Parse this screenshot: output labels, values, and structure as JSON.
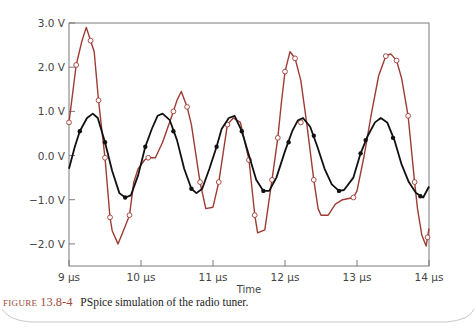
{
  "chart_data": {
    "type": "line",
    "title": "",
    "xlabel": "Time",
    "ylabel": "",
    "xlim": [
      9,
      14
    ],
    "ylim": [
      -2.5,
      3.0
    ],
    "grid": false,
    "legend": "none",
    "x_ticks": [
      {
        "value": 9,
        "label": "9 µs"
      },
      {
        "value": 10,
        "label": "10 µs"
      },
      {
        "value": 11,
        "label": "11 µs"
      },
      {
        "value": 12,
        "label": "12 µs"
      },
      {
        "value": 13,
        "label": "13 µs"
      },
      {
        "value": 14,
        "label": "14 µs"
      }
    ],
    "y_ticks": [
      {
        "value": 3.0,
        "label": "3.0 V"
      },
      {
        "value": 2.0,
        "label": "2.0 V"
      },
      {
        "value": 1.0,
        "label": "1.0 V"
      },
      {
        "value": 0.0,
        "label": "0.0 V"
      },
      {
        "value": -1.0,
        "label": "-1.0 V"
      },
      {
        "value": -2.0,
        "label": "-2.0 V"
      }
    ],
    "series": [
      {
        "name": "output (open-circle markers)",
        "color": "#9e3b33",
        "marker": "open-circle",
        "points": [
          [
            9.0,
            0.75
          ],
          [
            9.1,
            2.05
          ],
          [
            9.18,
            2.6
          ],
          [
            9.24,
            2.9
          ],
          [
            9.3,
            2.6
          ],
          [
            9.35,
            2.35
          ],
          [
            9.41,
            1.25
          ],
          [
            9.5,
            -0.05
          ],
          [
            9.57,
            -1.4
          ],
          [
            9.6,
            -1.7
          ],
          [
            9.68,
            -2.0
          ],
          [
            9.78,
            -1.6
          ],
          [
            9.84,
            -1.35
          ],
          [
            9.9,
            -0.6
          ],
          [
            9.96,
            -0.3
          ],
          [
            10.05,
            -0.1
          ],
          [
            10.1,
            -0.05
          ],
          [
            10.2,
            -0.05
          ],
          [
            10.3,
            0.3
          ],
          [
            10.45,
            1.0
          ],
          [
            10.5,
            1.25
          ],
          [
            10.56,
            1.45
          ],
          [
            10.64,
            1.1
          ],
          [
            10.7,
            0.7
          ],
          [
            10.82,
            -0.6
          ],
          [
            10.9,
            -1.2
          ],
          [
            11.0,
            -1.17
          ],
          [
            11.08,
            -0.6
          ],
          [
            11.2,
            0.7
          ],
          [
            11.28,
            0.85
          ],
          [
            11.38,
            0.75
          ],
          [
            11.5,
            -0.1
          ],
          [
            11.58,
            -1.35
          ],
          [
            11.62,
            -1.75
          ],
          [
            11.72,
            -1.68
          ],
          [
            11.82,
            -0.55
          ],
          [
            11.9,
            0.4
          ],
          [
            11.95,
            1.2
          ],
          [
            12.0,
            1.9
          ],
          [
            12.07,
            2.35
          ],
          [
            12.14,
            2.2
          ],
          [
            12.22,
            1.7
          ],
          [
            12.3,
            0.75
          ],
          [
            12.4,
            -0.55
          ],
          [
            12.46,
            -1.2
          ],
          [
            12.5,
            -1.35
          ],
          [
            12.6,
            -1.35
          ],
          [
            12.7,
            -1.1
          ],
          [
            12.8,
            -1.0
          ],
          [
            12.95,
            -0.95
          ],
          [
            13.0,
            -0.8
          ],
          [
            13.1,
            0.0
          ],
          [
            13.2,
            0.95
          ],
          [
            13.3,
            1.8
          ],
          [
            13.4,
            2.25
          ],
          [
            13.47,
            2.3
          ],
          [
            13.55,
            2.15
          ],
          [
            13.62,
            1.75
          ],
          [
            13.71,
            0.9
          ],
          [
            13.8,
            -0.6
          ],
          [
            13.84,
            -1.2
          ],
          [
            13.9,
            -1.8
          ],
          [
            13.96,
            -2.05
          ],
          [
            14.0,
            -1.65
          ]
        ],
        "markers": [
          [
            9.0,
            0.75
          ],
          [
            9.1,
            2.05
          ],
          [
            9.3,
            2.6
          ],
          [
            9.41,
            1.25
          ],
          [
            9.5,
            -0.05
          ],
          [
            9.57,
            -1.4
          ],
          [
            9.84,
            -1.35
          ],
          [
            10.1,
            -0.05
          ],
          [
            10.45,
            1.0
          ],
          [
            10.64,
            1.1
          ],
          [
            10.82,
            -0.6
          ],
          [
            11.08,
            -0.6
          ],
          [
            11.2,
            0.7
          ],
          [
            11.5,
            -0.1
          ],
          [
            11.58,
            -1.35
          ],
          [
            11.82,
            -0.55
          ],
          [
            11.9,
            0.4
          ],
          [
            12.0,
            1.9
          ],
          [
            12.14,
            2.2
          ],
          [
            12.22,
            0.75
          ],
          [
            12.4,
            -0.55
          ],
          [
            12.95,
            -0.95
          ],
          [
            13.4,
            2.25
          ],
          [
            13.55,
            2.15
          ],
          [
            13.71,
            0.9
          ],
          [
            13.8,
            -0.6
          ],
          [
            13.98,
            -1.85
          ]
        ]
      },
      {
        "name": "input (filled-dot markers)",
        "color": "#111111",
        "marker": "filled-dot",
        "points": [
          [
            9.0,
            -0.3
          ],
          [
            9.08,
            0.2
          ],
          [
            9.15,
            0.55
          ],
          [
            9.25,
            0.85
          ],
          [
            9.33,
            0.95
          ],
          [
            9.4,
            0.85
          ],
          [
            9.5,
            0.3
          ],
          [
            9.6,
            -0.35
          ],
          [
            9.7,
            -0.85
          ],
          [
            9.78,
            -0.95
          ],
          [
            9.86,
            -0.9
          ],
          [
            9.96,
            -0.45
          ],
          [
            10.06,
            0.2
          ],
          [
            10.15,
            0.6
          ],
          [
            10.23,
            0.9
          ],
          [
            10.3,
            0.95
          ],
          [
            10.4,
            0.8
          ],
          [
            10.5,
            0.35
          ],
          [
            10.6,
            -0.3
          ],
          [
            10.7,
            -0.75
          ],
          [
            10.77,
            -0.85
          ],
          [
            10.85,
            -0.75
          ],
          [
            10.95,
            -0.3
          ],
          [
            11.05,
            0.2
          ],
          [
            11.12,
            0.6
          ],
          [
            11.22,
            0.85
          ],
          [
            11.3,
            0.9
          ],
          [
            11.4,
            0.55
          ],
          [
            11.5,
            0.0
          ],
          [
            11.6,
            -0.55
          ],
          [
            11.7,
            -0.8
          ],
          [
            11.78,
            -0.8
          ],
          [
            11.88,
            -0.5
          ],
          [
            12.0,
            0.1
          ],
          [
            12.1,
            0.55
          ],
          [
            12.18,
            0.8
          ],
          [
            12.25,
            0.85
          ],
          [
            12.35,
            0.65
          ],
          [
            12.45,
            0.2
          ],
          [
            12.55,
            -0.3
          ],
          [
            12.65,
            -0.65
          ],
          [
            12.75,
            -0.8
          ],
          [
            12.82,
            -0.78
          ],
          [
            12.95,
            -0.5
          ],
          [
            13.05,
            0.05
          ],
          [
            13.15,
            0.45
          ],
          [
            13.25,
            0.75
          ],
          [
            13.33,
            0.85
          ],
          [
            13.42,
            0.75
          ],
          [
            13.52,
            0.35
          ],
          [
            13.62,
            -0.2
          ],
          [
            13.72,
            -0.6
          ],
          [
            13.82,
            -0.85
          ],
          [
            13.92,
            -0.95
          ],
          [
            14.0,
            -0.7
          ]
        ],
        "markers": [
          [
            9.15,
            0.55
          ],
          [
            9.5,
            0.3
          ],
          [
            9.78,
            -0.95
          ],
          [
            10.06,
            0.2
          ],
          [
            10.45,
            0.55
          ],
          [
            10.7,
            -0.75
          ],
          [
            11.05,
            0.2
          ],
          [
            11.4,
            0.55
          ],
          [
            11.7,
            -0.8
          ],
          [
            12.05,
            0.3
          ],
          [
            12.4,
            0.45
          ],
          [
            12.75,
            -0.8
          ],
          [
            13.05,
            0.05
          ],
          [
            13.12,
            0.35
          ],
          [
            13.5,
            0.4
          ],
          [
            13.88,
            -0.92
          ]
        ]
      }
    ]
  },
  "figure": {
    "xlabel": "Time",
    "caption_word": "FIGURE",
    "caption_number": "13.8-4",
    "caption_text": "PSpice simulation of the radio tuner."
  }
}
